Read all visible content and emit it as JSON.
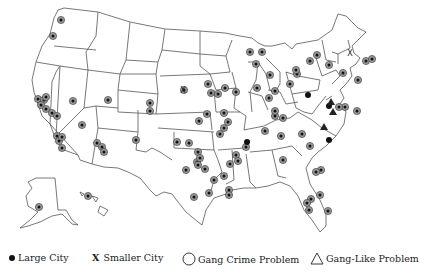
{
  "map": {
    "type": "choropleth-less point map",
    "region": "United States (incl. Alaska and Hawaii insets)",
    "symbols": {
      "large_city_gang_crime": [
        [
          61,
          20
        ],
        [
          53,
          36
        ],
        [
          38,
          99
        ],
        [
          44,
          100
        ],
        [
          46,
          97
        ],
        [
          41,
          105
        ],
        [
          46,
          109
        ],
        [
          52,
          113
        ],
        [
          57,
          116
        ],
        [
          73,
          101
        ],
        [
          108,
          100
        ],
        [
          82,
          125
        ],
        [
          57,
          136
        ],
        [
          59,
          141
        ],
        [
          62,
          137
        ],
        [
          62,
          148
        ],
        [
          97,
          143
        ],
        [
          102,
          147
        ],
        [
          104,
          152
        ],
        [
          136,
          140
        ],
        [
          150,
          103
        ],
        [
          150,
          111
        ],
        [
          199,
          121
        ],
        [
          184,
          90
        ],
        [
          208,
          84
        ],
        [
          211,
          93
        ],
        [
          207,
          114
        ],
        [
          177,
          142
        ],
        [
          189,
          143
        ],
        [
          224,
          113
        ],
        [
          220,
          134
        ],
        [
          198,
          152
        ],
        [
          197,
          162
        ],
        [
          186,
          170
        ],
        [
          214,
          180
        ],
        [
          194,
          197
        ],
        [
          205,
          169
        ],
        [
          198,
          165
        ],
        [
          200,
          158
        ],
        [
          209,
          193
        ],
        [
          224,
          176
        ],
        [
          236,
          155
        ],
        [
          230,
          164
        ],
        [
          238,
          161
        ],
        [
          229,
          190
        ],
        [
          229,
          195
        ],
        [
          265,
          131
        ],
        [
          281,
          136
        ],
        [
          283,
          160
        ],
        [
          246,
          147
        ],
        [
          224,
          128
        ],
        [
          228,
          122
        ],
        [
          250,
          52
        ],
        [
          256,
          64
        ],
        [
          262,
          52
        ],
        [
          270,
          75
        ],
        [
          257,
          88
        ],
        [
          275,
          91
        ],
        [
          269,
          98
        ],
        [
          290,
          84
        ],
        [
          275,
          116
        ],
        [
          283,
          118
        ],
        [
          297,
          74
        ],
        [
          296,
          70
        ],
        [
          310,
          61
        ],
        [
          317,
          55
        ],
        [
          329,
          65
        ],
        [
          343,
          73
        ],
        [
          358,
          80
        ],
        [
          366,
          61
        ],
        [
          372,
          59
        ],
        [
          345,
          107
        ],
        [
          339,
          107
        ],
        [
          357,
          111
        ],
        [
          225,
          88
        ],
        [
          236,
          92
        ],
        [
          218,
          94
        ],
        [
          302,
          134
        ],
        [
          310,
          146
        ],
        [
          321,
          170
        ],
        [
          316,
          172
        ],
        [
          311,
          199
        ],
        [
          309,
          210
        ],
        [
          307,
          203
        ],
        [
          320,
          195
        ],
        [
          328,
          211
        ],
        [
          275,
          111
        ],
        [
          39,
          207
        ],
        [
          88,
          196
        ],
        [
          144,
          249
        ]
      ],
      "large_city_only": [
        [
          247,
          142
        ],
        [
          308,
          95
        ],
        [
          329,
          106
        ],
        [
          329,
          140
        ]
      ],
      "smaller_city": [
        [
          183,
          90
        ],
        [
          350,
          53
        ]
      ],
      "gang_like_problem": [
        [
          324,
          127
        ],
        [
          331,
          102
        ],
        [
          333,
          112
        ]
      ]
    }
  },
  "legend": {
    "items": [
      {
        "symbol": "filled-dot",
        "label": "Large City"
      },
      {
        "symbol": "x-mark",
        "label": "X  Smaller City"
      },
      {
        "symbol": "circle",
        "label": "Gang Crime Problem"
      },
      {
        "symbol": "triangle",
        "label": "Gang-Like Problem"
      }
    ],
    "labels": {
      "large_city": "Large City",
      "smaller_city": "Smaller City",
      "smaller_city_mark": "X",
      "gang_crime": "Gang Crime Problem",
      "gang_like": "Gang-Like Problem"
    }
  },
  "colors": {
    "background": "#ffffff",
    "state_border": "#555555",
    "marker_ring": "#9a9a9a",
    "marker_dot": "#111111"
  }
}
